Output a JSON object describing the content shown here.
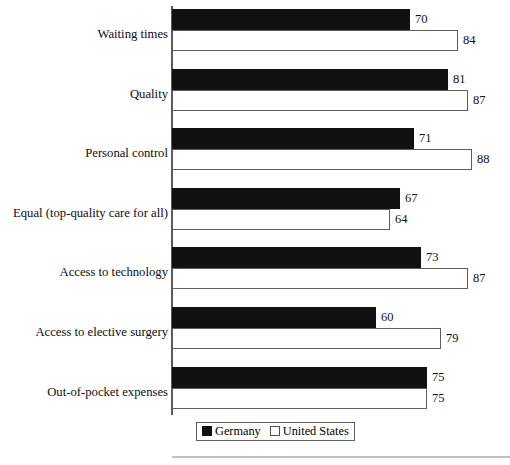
{
  "chart_data": {
    "type": "bar",
    "orientation": "horizontal",
    "title": "",
    "subtitle": "",
    "xlabel": "",
    "ylabel": "",
    "xlim": [
      0,
      100
    ],
    "grid": false,
    "legend_position": "bottom",
    "categories": [
      "Waiting times",
      "Quality",
      "Personal control",
      "Equal (top-quality care for all)",
      "Access to technology",
      "Access to elective surgery",
      "Out-of-pocket expenses"
    ],
    "series": [
      {
        "name": "Germany",
        "color": "#111111",
        "values": [
          70,
          81,
          71,
          67,
          73,
          60,
          75
        ]
      },
      {
        "name": "United States",
        "color": "#ffffff",
        "values": [
          84,
          87,
          88,
          64,
          87,
          79,
          75
        ]
      }
    ]
  },
  "legend": {
    "items": [
      {
        "label": "Germany",
        "swatch": "filled-black-swatch"
      },
      {
        "label": "United States",
        "swatch": "outlined-white-swatch"
      }
    ]
  }
}
